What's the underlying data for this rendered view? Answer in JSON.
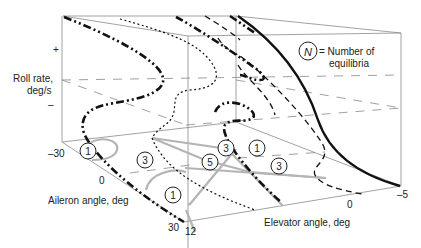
{
  "figure": {
    "y_axis": {
      "label_line1": "Roll rate,",
      "label_line2": "deg/s",
      "tick_plus": "+",
      "tick_minus": "–"
    },
    "aileron_axis": {
      "label": "Aileron angle, deg",
      "ticks": [
        "–30",
        "0",
        "30"
      ]
    },
    "elevator_axis": {
      "label": "Elevator angle, deg",
      "ticks": [
        "12",
        "0",
        "–5"
      ]
    },
    "legend": {
      "symbol": "N",
      "text_line1": "= Number of",
      "text_line2": "equilibria"
    },
    "region_badges": [
      {
        "value": "1",
        "region": "left-back"
      },
      {
        "value": "3",
        "region": "center-left"
      },
      {
        "value": "1",
        "region": "left-front"
      },
      {
        "value": "3",
        "region": "center"
      },
      {
        "value": "5",
        "region": "center"
      },
      {
        "value": "1",
        "region": "center-right"
      },
      {
        "value": "3",
        "region": "right"
      }
    ],
    "curve_styles": [
      "solid",
      "dash-dot-dot",
      "dashed",
      "dotted",
      "gray-projection"
    ]
  }
}
